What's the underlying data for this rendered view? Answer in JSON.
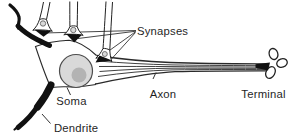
{
  "figure": {
    "labels": {
      "synapses": "Synapses",
      "soma": "Soma",
      "axon": "Axon",
      "terminal": "Terminal",
      "dendrite": "Dendrite"
    },
    "colors": {
      "ink": "#1f1f1f",
      "line": "#2a2a2a",
      "pointer": "#333333",
      "background": "#ffffff",
      "nucleus_fill": "#d9d9d9",
      "nucleus_stroke": "#4d4d4d",
      "nucleolus_fill": "#b3b3b3",
      "vesicle_fill": "#d9d9d9"
    }
  }
}
